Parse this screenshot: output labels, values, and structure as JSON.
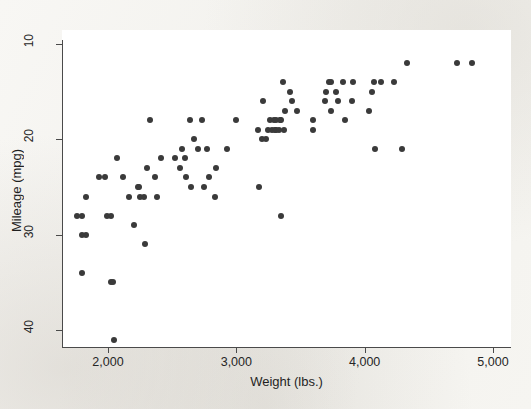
{
  "chart_data": {
    "type": "scatter",
    "title": "",
    "xlabel": "Weight (lbs.)",
    "ylabel": "Mileage (mpg)",
    "xlim": [
      1670,
      4900
    ],
    "ylim": [
      10,
      41
    ],
    "y_axis_inverted": true,
    "grid": false,
    "legend": null,
    "marker_color": "#3a3a3a",
    "marker_size_px": 6,
    "xticks": [
      {
        "value": 2000,
        "label": "2,000"
      },
      {
        "value": 3000,
        "label": "3,000"
      },
      {
        "value": 4000,
        "label": "4,000"
      },
      {
        "value": 5000,
        "label": "5,000"
      }
    ],
    "yticks": [
      {
        "value": 10,
        "label": "10"
      },
      {
        "value": 20,
        "label": "20"
      },
      {
        "value": 30,
        "label": "30"
      },
      {
        "value": 40,
        "label": "40"
      }
    ],
    "series": [
      {
        "name": "Automobiles",
        "points": [
          [
            1760,
            28
          ],
          [
            1800,
            28
          ],
          [
            1800,
            30
          ],
          [
            1830,
            30
          ],
          [
            1800,
            34
          ],
          [
            1830,
            26
          ],
          [
            1930,
            24
          ],
          [
            1980,
            24
          ],
          [
            1990,
            28
          ],
          [
            2020,
            28
          ],
          [
            2020,
            35
          ],
          [
            2040,
            35
          ],
          [
            2050,
            41
          ],
          [
            2070,
            22
          ],
          [
            2120,
            24
          ],
          [
            2160,
            26
          ],
          [
            2200,
            29
          ],
          [
            2230,
            25
          ],
          [
            2240,
            25
          ],
          [
            2250,
            26
          ],
          [
            2280,
            26
          ],
          [
            2290,
            31
          ],
          [
            2300,
            23
          ],
          [
            2330,
            18
          ],
          [
            2370,
            24
          ],
          [
            2380,
            26
          ],
          [
            2410,
            22
          ],
          [
            2520,
            22
          ],
          [
            2560,
            23
          ],
          [
            2580,
            21
          ],
          [
            2600,
            22
          ],
          [
            2610,
            24
          ],
          [
            2640,
            18
          ],
          [
            2650,
            25
          ],
          [
            2670,
            20
          ],
          [
            2700,
            21
          ],
          [
            2730,
            18
          ],
          [
            2750,
            25
          ],
          [
            2770,
            21
          ],
          [
            2790,
            24
          ],
          [
            2830,
            26
          ],
          [
            2840,
            23
          ],
          [
            2930,
            21
          ],
          [
            3000,
            18
          ],
          [
            3170,
            19
          ],
          [
            3180,
            25
          ],
          [
            3200,
            20
          ],
          [
            3210,
            16
          ],
          [
            3230,
            20
          ],
          [
            3250,
            19
          ],
          [
            3260,
            18
          ],
          [
            3280,
            19
          ],
          [
            3290,
            18
          ],
          [
            3300,
            19
          ],
          [
            3310,
            18
          ],
          [
            3310,
            19
          ],
          [
            3330,
            19
          ],
          [
            3340,
            18
          ],
          [
            3350,
            18
          ],
          [
            3350,
            28
          ],
          [
            3360,
            14
          ],
          [
            3370,
            19
          ],
          [
            3380,
            17
          ],
          [
            3420,
            15
          ],
          [
            3430,
            16
          ],
          [
            3470,
            17
          ],
          [
            3600,
            19
          ],
          [
            3600,
            18
          ],
          [
            3690,
            16
          ],
          [
            3700,
            15
          ],
          [
            3720,
            14
          ],
          [
            3740,
            17
          ],
          [
            3740,
            14
          ],
          [
            3780,
            15
          ],
          [
            3790,
            16
          ],
          [
            3830,
            14
          ],
          [
            3850,
            18
          ],
          [
            3900,
            16
          ],
          [
            3910,
            14
          ],
          [
            4030,
            17
          ],
          [
            4060,
            15
          ],
          [
            4070,
            14
          ],
          [
            4080,
            21
          ],
          [
            4130,
            14
          ],
          [
            4230,
            14
          ],
          [
            4290,
            21
          ],
          [
            4330,
            12
          ],
          [
            4720,
            12
          ],
          [
            4840,
            12
          ]
        ]
      }
    ]
  },
  "figure": {
    "y_axis_title": "Mileage (mpg)",
    "x_axis_title": "Weight (lbs.)"
  }
}
